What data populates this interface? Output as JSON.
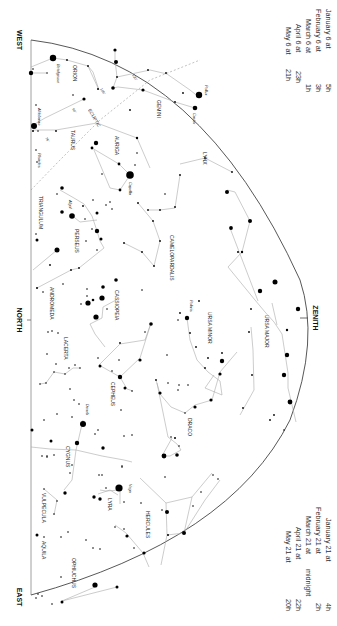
{
  "chart": {
    "directions": {
      "west": "WEST",
      "north": "NORTH",
      "east": "EAST",
      "zenith": "ZENITH"
    },
    "ecliptic": {
      "label": "ECLIPTIC",
      "markers": [
        "60°",
        "75°",
        "90°",
        "105°",
        "120°"
      ]
    },
    "times_top": [
      {
        "date": "January 6 at",
        "hour": "5h"
      },
      {
        "date": "February 6 at",
        "hour": "3h"
      },
      {
        "date": "March 6 at",
        "hour": "1h"
      },
      {
        "date": "April 6 at",
        "hour": "23h"
      },
      {
        "date": "May 6 at",
        "hour": "21h"
      }
    ],
    "times_bottom": [
      {
        "date": "January 21 at",
        "hour": "4h"
      },
      {
        "date": "February 21 at",
        "hour": "2h"
      },
      {
        "date": "March 21 at",
        "hour": "midnight"
      },
      {
        "date": "April 21 at",
        "hour": "22h"
      },
      {
        "date": "May 21 at",
        "hour": "20h"
      }
    ],
    "constellations": [
      "ORION",
      "GEMINI",
      "TAURUS",
      "AURIGA",
      "LYNX",
      "TRIANGULUM",
      "PERSEUS",
      "CAMELOPARDALIS",
      "URSA MAJOR",
      "URSA MINOR",
      "ANDROMEDA",
      "CASSIOPEIA",
      "LACERTA",
      "CEPHEUS",
      "DRACO",
      "CYGNUS",
      "LYRA",
      "HERCULES",
      "VULPECULA",
      "AQUILA",
      "OPHIUCHUS"
    ],
    "stars": [
      "Betelgeuse",
      "Aldebaran",
      "Pleiades",
      "Pollux",
      "Castor",
      "Capella",
      "Algol",
      "Polaris",
      "Deneb",
      "Vega"
    ]
  }
}
